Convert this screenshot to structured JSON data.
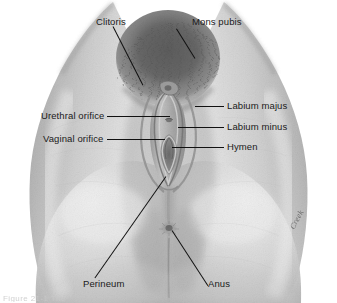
{
  "figure": {
    "background_color": "#ffffff",
    "ink_color": "#111111",
    "text_color": "#1a1a1a"
  },
  "labels": {
    "clitoris": "Clitoris",
    "mons_pubis": "Mons pubis",
    "urethral_orifice": "Urethral orifice",
    "vaginal_orifice": "Vaginal orifice",
    "labium_majus": "Labium majus",
    "labium_minus": "Labium minus",
    "hymen": "Hymen",
    "perineum": "Perineum",
    "anus": "Anus"
  },
  "signature": {
    "artist": "Creek"
  },
  "caption": {
    "text": "Figure  21-1  The"
  }
}
